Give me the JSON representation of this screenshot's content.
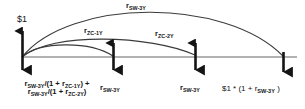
{
  "diagram": {
    "type": "cash-flow-timeline",
    "title": "",
    "colors": {
      "line": "#555555",
      "arrow": "#141414",
      "arc": "#3b3b3b",
      "dotted": "#9a9a9a",
      "background": "#ffffff"
    },
    "axis": {
      "y": 57,
      "x_start": 22,
      "x_end": 297
    },
    "nodes": [
      {
        "id": "t0",
        "x": 22,
        "up_arrow": true,
        "down_arrow": true
      },
      {
        "id": "t1",
        "x": 113,
        "up_arrow": true,
        "down_arrow": true
      },
      {
        "id": "t2",
        "x": 195,
        "up_arrow": true,
        "down_arrow": true
      },
      {
        "id": "t3",
        "x": 283,
        "up_arrow": false,
        "down_arrow": true
      }
    ],
    "arcs": [
      {
        "id": "arc-sw-3y",
        "from_x": 22,
        "to_x": 283,
        "peak_y": 14,
        "label": "r_SW-3Y"
      },
      {
        "id": "arc-zc-2y",
        "from_x": 22,
        "to_x": 195,
        "peak_y": 40,
        "label": "r_ZC-2Y"
      },
      {
        "id": "arc-zc-1y",
        "from_x": 22,
        "to_x": 113,
        "peak_y": 46,
        "label": "r_ZC-1Y"
      }
    ]
  },
  "labels": {
    "arc_sw_3y": {
      "base": "r",
      "sub": "SW-3Y"
    },
    "arc_zc_1y": {
      "base": "r",
      "sub": "ZC-1Y"
    },
    "arc_zc_2y": {
      "base": "r",
      "sub": "ZC-2Y"
    },
    "dollar_inflow": "$1",
    "bottom_t0_line1_a": "r",
    "bottom_t0_line1_a_sub": "SW-3Y",
    "bottom_t0_line1_b": "/(1 + r",
    "bottom_t0_line1_b_sub": "ZC-1Y",
    "bottom_t0_line1_c": ") +",
    "bottom_t0_line2_a": "r",
    "bottom_t0_line2_a_sub": "SW-3Y",
    "bottom_t0_line2_b": "/(1 + r",
    "bottom_t0_line2_b_sub": "ZC-2Y",
    "bottom_t0_line2_c": ")",
    "bottom_t1": {
      "base": "r",
      "sub": "SW-3Y"
    },
    "bottom_t2": {
      "base": "r",
      "sub": "SW-3Y"
    },
    "bottom_t3_prefix": "$1 * (1 + r",
    "bottom_t3_sub": "SW-3Y",
    "bottom_t3_suffix": " )"
  }
}
